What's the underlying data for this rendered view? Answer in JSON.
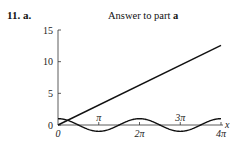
{
  "header": {
    "problem_number": "11.",
    "part": "a.",
    "title_prefix": "Answer to part ",
    "title_part": "a"
  },
  "chart_data": {
    "type": "line",
    "title": "Answer to part a",
    "xlabel": "x",
    "ylabel": "",
    "xlim": [
      0,
      12.566
    ],
    "ylim": [
      0,
      15
    ],
    "x_ticks": [
      {
        "value": 0,
        "label": "0",
        "position": "below"
      },
      {
        "value": 3.1416,
        "label": "π",
        "position": "above"
      },
      {
        "value": 6.2832,
        "label": "2π",
        "position": "below"
      },
      {
        "value": 9.4248,
        "label": "3π",
        "position": "above"
      },
      {
        "value": 12.566,
        "label": "4π",
        "position": "below"
      }
    ],
    "y_ticks": [
      {
        "value": 0,
        "label": "0"
      },
      {
        "value": 5,
        "label": "5"
      },
      {
        "value": 10,
        "label": "10"
      },
      {
        "value": 15,
        "label": "15"
      }
    ],
    "grid": false,
    "legend": null,
    "series": [
      {
        "name": "y = x",
        "x": [
          0,
          12.566
        ],
        "y": [
          0,
          12.566
        ]
      },
      {
        "name": "y = cos x",
        "x": [
          0,
          3.1416,
          6.2832,
          9.4248,
          12.566
        ],
        "y": [
          1,
          -1,
          1,
          -1,
          1
        ]
      }
    ]
  }
}
